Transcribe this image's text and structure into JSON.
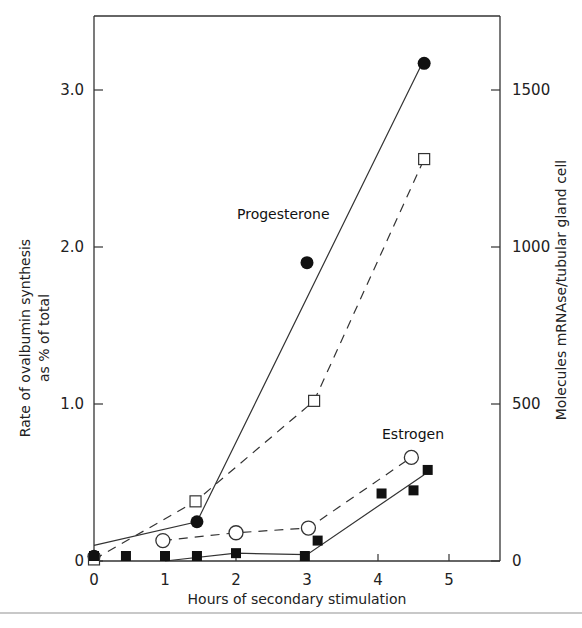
{
  "chart_data": {
    "type": "line",
    "title": "",
    "xlabel": "Hours of secondary stimulation",
    "ylabel": "Rate of ovalbumin synthesis as % of total",
    "ylabel_lines": [
      "Rate of ovalbumin synthesis",
      "as % of total"
    ],
    "y2label": "Molecules mRNAse/tubular gland cell",
    "xlim": [
      0,
      5.5
    ],
    "ylim": [
      0,
      3.45
    ],
    "y2lim": [
      0,
      1725
    ],
    "xticks": [
      0,
      1,
      2,
      3,
      4,
      5
    ],
    "xtick_labels": [
      "0",
      "1",
      "2",
      "3",
      "4",
      "5"
    ],
    "yticks": [
      0,
      1.0,
      2.0,
      3.0
    ],
    "ytick_labels": [
      "0",
      "1.0",
      "2.0",
      "3.0"
    ],
    "y2ticks": [
      0,
      500,
      1000,
      1500
    ],
    "y2tick_labels": [
      "0",
      "500",
      "1000",
      "1500"
    ],
    "grid": false,
    "legend": "none (inline annotations)",
    "annotations": [
      {
        "text": "Progesterone",
        "x": 2.0,
        "y": 2.2
      },
      {
        "text": "Estrogen",
        "x": 4.2,
        "y": 0.85
      }
    ],
    "series": [
      {
        "name": "Progesterone - ovalbumin synthesis",
        "axis": "left",
        "marker": "filled-circle",
        "line": "solid",
        "points": [
          [
            0,
            0.03
          ],
          [
            1.45,
            0.25
          ],
          [
            3.0,
            1.9
          ],
          [
            4.65,
            3.17
          ]
        ],
        "fit_line": [
          [
            0,
            0.1
          ],
          [
            1.45,
            0.25
          ],
          [
            4.6,
            3.15
          ]
        ]
      },
      {
        "name": "Progesterone - mRNA molecules",
        "axis": "right",
        "marker": "open-square",
        "line": "dashed",
        "points": [
          [
            0,
            5
          ],
          [
            1.43,
            190
          ],
          [
            3.1,
            510
          ],
          [
            4.65,
            1280
          ]
        ]
      },
      {
        "name": "Estrogen - mRNA molecules",
        "axis": "right",
        "marker": "open-circle",
        "line": "dashed",
        "points": [
          [
            0.97,
            65
          ],
          [
            2.0,
            90
          ],
          [
            3.02,
            105
          ],
          [
            4.47,
            330
          ]
        ]
      },
      {
        "name": "Estrogen - ovalbumin synthesis",
        "axis": "left",
        "marker": "filled-square",
        "line": "solid",
        "points": [
          [
            0,
            0.02
          ],
          [
            0.45,
            0.0
          ],
          [
            1.0,
            0.0
          ],
          [
            1.45,
            0.03
          ],
          [
            2.0,
            0.05
          ],
          [
            2.97,
            0.03
          ],
          [
            3.15,
            0.13
          ],
          [
            4.05,
            0.43
          ],
          [
            4.5,
            0.45
          ],
          [
            4.7,
            0.58
          ]
        ],
        "fit_line": [
          [
            1.0,
            0.0
          ],
          [
            2.0,
            0.05
          ],
          [
            3.0,
            0.04
          ],
          [
            4.65,
            0.55
          ]
        ]
      }
    ]
  }
}
